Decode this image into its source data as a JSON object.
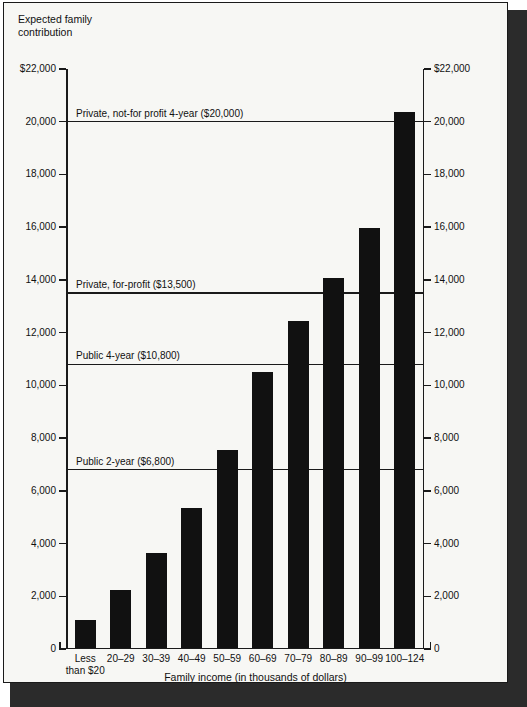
{
  "chart_data": {
    "type": "bar",
    "title": "Expected family\ncontribution",
    "xlabel": "Family income (in thousands of dollars)",
    "ylabel": "Expected family contribution",
    "ylim": [
      0,
      22000
    ],
    "grid": false,
    "legend": "none",
    "categories": [
      "Less\nthan $20",
      "20–29",
      "30–39",
      "40–49",
      "50–59",
      "60–69",
      "70–79",
      "80–89",
      "90–99",
      "100–124"
    ],
    "values": [
      1030,
      2200,
      3600,
      5300,
      7500,
      10450,
      12400,
      14000,
      15900,
      20300
    ],
    "yticks": [
      0,
      2000,
      4000,
      6000,
      8000,
      10000,
      12000,
      14000,
      16000,
      18000,
      20000,
      22000
    ],
    "ytick_labels_left": [
      "0",
      "2,000",
      "4,000",
      "6,000",
      "8,000",
      "10,000",
      "12,000",
      "14,000",
      "16,000",
      "18,000",
      "20,000",
      "$22,000"
    ],
    "ytick_labels_right": [
      "0",
      "2,000",
      "4,000",
      "6,000",
      "8,000",
      "10,000",
      "12,000",
      "14,000",
      "16,000",
      "18,000",
      "20,000",
      "$22,000"
    ],
    "reference_lines": [
      {
        "label": "Private, not-for profit 4-year ($20,000)",
        "value": 20000
      },
      {
        "label": "Private, for-profit ($13,500)",
        "value": 13500
      },
      {
        "label": "Public 4-year ($10,800)",
        "value": 10800
      },
      {
        "label": "Public 2-year ($6,800)",
        "value": 6800
      }
    ],
    "colors": {
      "bar": "#111111",
      "axis": "#1a1a1a",
      "background": "#f7f7f4",
      "text": "#111111"
    }
  }
}
